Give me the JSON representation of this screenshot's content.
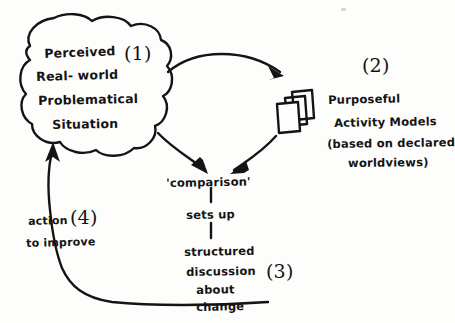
{
  "diagram": {
    "ink_color": "#141414",
    "paper_color": "#fdfdfb",
    "style": "hand-drawn sketch"
  },
  "cloud": {
    "label_number": "(1)",
    "lines": [
      "Perceived",
      "Real- world",
      "Problematical",
      "Situation"
    ]
  },
  "models": {
    "label_number": "(2)",
    "lines": [
      "Purposeful",
      "Activity Models",
      "(based on declared",
      "worldviews)"
    ],
    "icon": "stacked-cards-icon"
  },
  "center": {
    "comparison": "'comparison'",
    "sets_up": "sets up",
    "outcome_lines": [
      "structured",
      "discussion",
      "about",
      "change"
    ],
    "label_number": "(3)"
  },
  "action": {
    "line1": "action",
    "line2": "to improve",
    "label_number": "(4)"
  },
  "arrows": {
    "cloud_to_models": "arc-arrow-right",
    "cloud_to_comparison": "arc-arrow-down-right",
    "models_to_comparison": "arc-arrow-down-left",
    "feedback_to_cloud": "loop-arrow-up"
  }
}
